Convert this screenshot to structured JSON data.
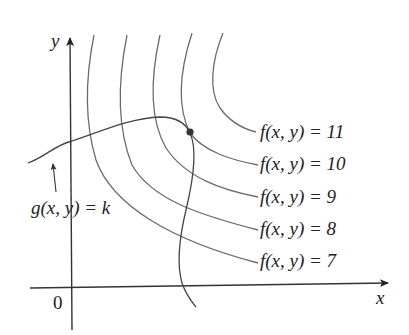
{
  "diagram": {
    "type": "level-curves-with-constraint",
    "axes": {
      "x_label": "x",
      "y_label": "y",
      "origin_label": "0"
    },
    "level_curves": [
      {
        "label": "f(x, y) = 11",
        "func": "f",
        "value": "11"
      },
      {
        "label": "f(x, y) = 10",
        "func": "f",
        "value": "10"
      },
      {
        "label": "f(x, y) = 9",
        "func": "f",
        "value": "9"
      },
      {
        "label": "f(x, y) = 8",
        "func": "f",
        "value": "8"
      },
      {
        "label": "f(x, y) = 7",
        "func": "f",
        "value": "7"
      }
    ],
    "constraint_curve": {
      "label": "g(x, y) = k"
    },
    "tangent_point": {
      "description": "point where constraint curve touches level curve f(x, y) = 10"
    },
    "colors": {
      "curves": "#6b6b6b",
      "axes": "#333333",
      "text": "#222222",
      "point": "#333333"
    }
  }
}
